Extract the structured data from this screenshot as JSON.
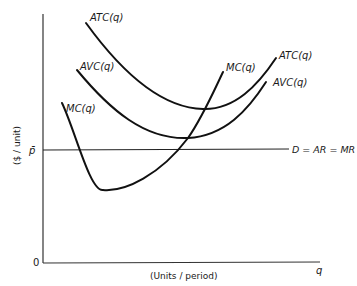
{
  "diagram": {
    "type": "economics cost curves (perfect competition, short run)",
    "axes": {
      "y_label": "($ / unit)",
      "x_label": "(Units / period)",
      "x_end_label": "q",
      "origin_label": "0"
    },
    "price_line": {
      "tick_label": "p̄",
      "line_label": "D = AR = MR"
    },
    "curves": [
      {
        "id": "atc",
        "label_left": "ATC(q)",
        "label_right": "ATC(q)"
      },
      {
        "id": "avc",
        "label_left": "AVC(q)",
        "label_right": "AVC(q)"
      },
      {
        "id": "mc",
        "label_left": "MC(q)",
        "label_right": "MC(q)"
      }
    ],
    "colors": {
      "ink": "#111111",
      "background": "#ffffff"
    }
  }
}
